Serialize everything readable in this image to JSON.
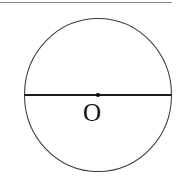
{
  "figure": {
    "background_color": "#ffffff",
    "width": 184,
    "height": 186,
    "top_rule": {
      "visible": true,
      "color": "#8c8c8c",
      "x_start": 0,
      "x_end": 172,
      "y": 2,
      "thickness": 1
    },
    "circle": {
      "center_x": 98,
      "center_y": 95,
      "radius_x": 73.5,
      "radius_y": 76.5,
      "stroke_color": "#3b3b3b",
      "stroke_width": 1
    },
    "diameter": {
      "label": "diameter",
      "x_start": 24.5,
      "x_end": 171.5,
      "y": 95,
      "color": "#1c1c1c",
      "thickness": 1.8
    },
    "center_point": {
      "label": "O",
      "x": 98,
      "y": 95,
      "dot_radius": 2.1,
      "dot_color": "#050505",
      "label_color": "#121212",
      "label_top": 100,
      "label_font_size": 25
    }
  }
}
